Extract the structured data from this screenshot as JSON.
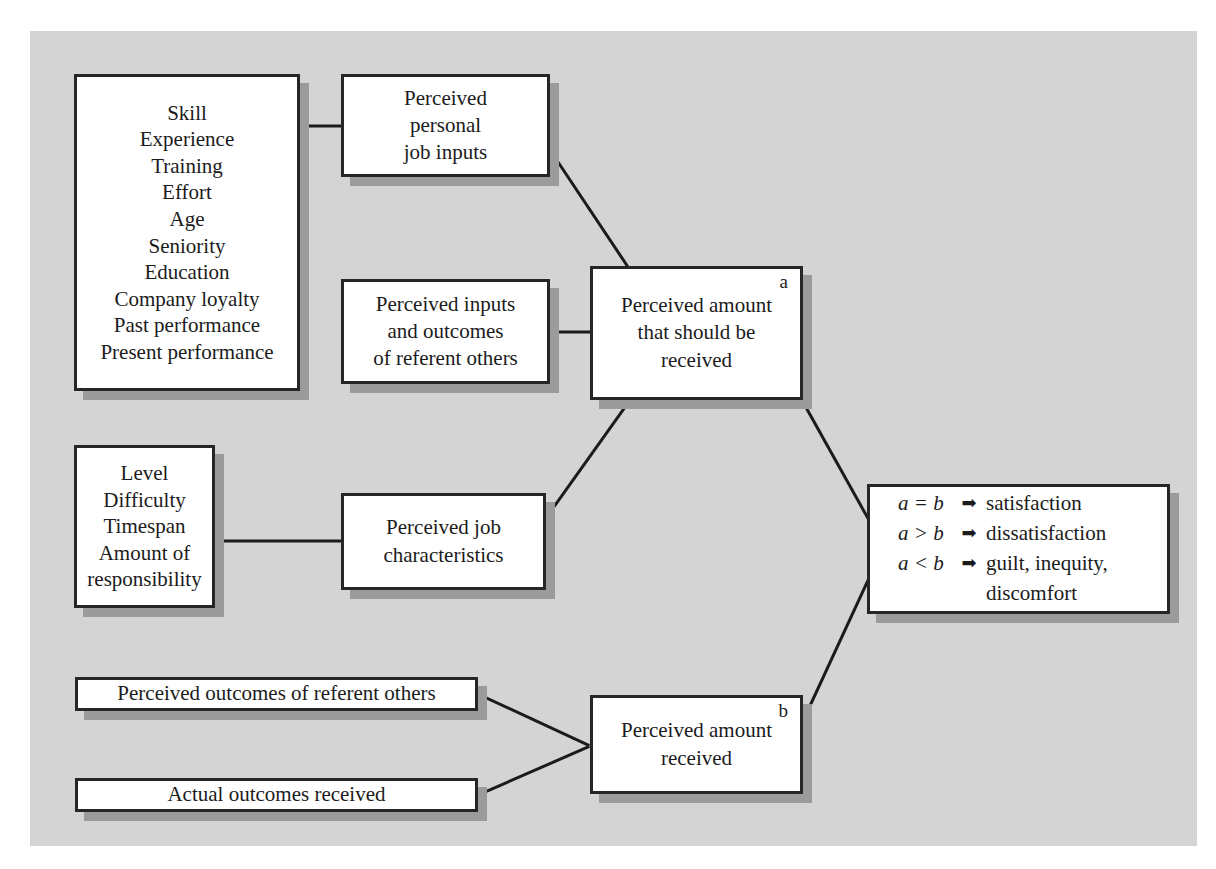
{
  "figure": {
    "background_color": "#d4d4d4",
    "box_border_color": "#262626",
    "box_fill_color": "#ffffff",
    "shadow_color": "#9b9b9b",
    "line_color": "#1b1b1b"
  },
  "nodes": {
    "personal_attributes": {
      "name": "personal-attributes-list",
      "lines": [
        "Skill",
        "Experience",
        "Training",
        "Effort",
        "Age",
        "Seniority",
        "Education",
        "Company loyalty",
        "Past performance",
        "Present performance"
      ]
    },
    "perceived_inputs": {
      "name": "perceived-personal-job-inputs",
      "lines": [
        "Perceived",
        "personal",
        "job inputs"
      ]
    },
    "referent_others": {
      "name": "perceived-inputs-outcomes-referent-others",
      "lines": [
        "Perceived inputs",
        "and outcomes",
        "of referent others"
      ]
    },
    "should_receive": {
      "name": "perceived-amount-should-be-received",
      "letter": "a",
      "lines": [
        "Perceived amount",
        "that should be",
        "received"
      ]
    },
    "job_attributes": {
      "name": "job-attributes-list",
      "lines": [
        "Level",
        "Difficulty",
        "Timespan",
        "Amount of",
        "responsibility"
      ]
    },
    "job_characteristics": {
      "name": "perceived-job-characteristics",
      "lines": [
        "Perceived job",
        "characteristics"
      ]
    },
    "equity_outcomes": {
      "name": "equity-comparison-outcomes",
      "rows": [
        {
          "expression": "a = b",
          "arrow": "➡",
          "result": "satisfaction"
        },
        {
          "expression": "a > b",
          "arrow": "➡",
          "result": "dissatisfaction"
        },
        {
          "expression": "a < b",
          "arrow": "➡",
          "result": "guilt, inequity,"
        }
      ],
      "continuation": "discomfort"
    },
    "perceived_outcomes": {
      "name": "perceived-outcomes-of-referent-others",
      "lines": [
        "Perceived outcomes of referent others"
      ]
    },
    "actual_outcomes": {
      "name": "actual-outcomes-received",
      "lines": [
        "Actual outcomes received"
      ]
    },
    "amount_received": {
      "name": "perceived-amount-received",
      "letter": "b",
      "lines": [
        "Perceived amount",
        "received"
      ]
    }
  },
  "connectors": [
    {
      "from": "personal-attributes-list",
      "to": "perceived-personal-job-inputs",
      "style": "horizontal"
    },
    {
      "from": "perceived-personal-job-inputs",
      "to": "perceived-amount-should-be-received",
      "style": "diagonal"
    },
    {
      "from": "perceived-inputs-outcomes-referent-others",
      "to": "perceived-amount-should-be-received",
      "style": "horizontal"
    },
    {
      "from": "job-attributes-list",
      "to": "perceived-job-characteristics",
      "style": "horizontal"
    },
    {
      "from": "perceived-job-characteristics",
      "to": "perceived-amount-should-be-received",
      "style": "diagonal"
    },
    {
      "from": "perceived-amount-should-be-received",
      "to": "equity-comparison-outcomes",
      "style": "diagonal"
    },
    {
      "from": "perceived-outcomes-of-referent-others",
      "to": "perceived-amount-received",
      "style": "diagonal"
    },
    {
      "from": "actual-outcomes-received",
      "to": "perceived-amount-received",
      "style": "diagonal"
    },
    {
      "from": "perceived-amount-received",
      "to": "equity-comparison-outcomes",
      "style": "diagonal"
    }
  ]
}
